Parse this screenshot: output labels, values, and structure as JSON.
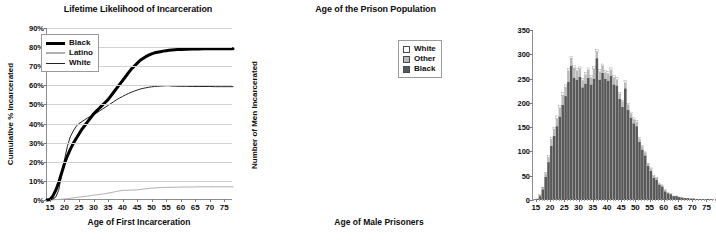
{
  "figure": {
    "background": "#ffffff"
  },
  "charts": [
    {
      "id": "lifetime-likelihood",
      "title": "Lifetime Likelihood of Incarceration",
      "xlabel": "Age of First Incarceration",
      "ylabel": "Cumulative % Incarcerated",
      "legend_position": "top-left",
      "legend": [
        {
          "label": "Black",
          "color": "#000000",
          "style": "thick-line"
        },
        {
          "label": "Latino",
          "color": "#b0b0b0",
          "style": "line"
        },
        {
          "label": "White",
          "color": "#222222",
          "style": "thin-line"
        }
      ],
      "yticks": [
        "0%",
        "10%",
        "20%",
        "30%",
        "40%",
        "50%",
        "60%",
        "70%",
        "80%",
        "90%"
      ],
      "xticks": [
        "15",
        "20",
        "25",
        "30",
        "35",
        "40",
        "45",
        "50",
        "55",
        "60",
        "65",
        "70",
        "75"
      ]
    },
    {
      "id": "age-of-prison-population",
      "title": "Age of the Prison Population",
      "xlabel": "Age of Male Prisoners",
      "ylabel": "Number of Men Incarcerated",
      "legend_position": "top-right",
      "legend": [
        {
          "label": "White",
          "color": "#ffffff",
          "style": "box"
        },
        {
          "label": "Other",
          "color": "#b9b9b9",
          "style": "box"
        },
        {
          "label": "Black",
          "color": "#595959",
          "style": "box"
        }
      ],
      "yticks": [
        "0",
        "50",
        "100",
        "150",
        "200",
        "250",
        "300",
        "350"
      ],
      "xticks": [
        "15",
        "20",
        "25",
        "30",
        "35",
        "40",
        "45",
        "50",
        "55",
        "60",
        "65",
        "70",
        "75"
      ]
    }
  ],
  "chart_data": [
    {
      "type": "line",
      "id": "lifetime-likelihood",
      "title": "Lifetime Likelihood of Incarceration",
      "xlabel": "Age of First Incarceration",
      "ylabel": "Cumulative % Incarcerated",
      "xlim": [
        14,
        78
      ],
      "ylim": [
        0,
        90
      ],
      "grid": true,
      "legend": "top-left inside",
      "x": [
        14,
        15,
        16,
        17,
        18,
        19,
        20,
        21,
        22,
        23,
        24,
        25,
        26,
        27,
        28,
        29,
        30,
        31,
        32,
        33,
        34,
        35,
        36,
        37,
        38,
        39,
        40,
        41,
        42,
        43,
        44,
        45,
        46,
        47,
        48,
        49,
        50,
        51,
        52,
        53,
        54,
        55,
        56,
        57,
        58,
        59,
        60,
        62,
        64,
        66,
        68,
        70,
        72,
        74,
        76,
        78
      ],
      "series": [
        {
          "name": "Black",
          "color": "#000000",
          "values": [
            0,
            0.3,
            2,
            5,
            9,
            14,
            19,
            23,
            26.5,
            29.5,
            32,
            34.5,
            37,
            39,
            41,
            43,
            45,
            46.5,
            48,
            49.5,
            51,
            52.5,
            54.5,
            56.5,
            58.5,
            60.5,
            62.5,
            64.5,
            66.5,
            68.5,
            70,
            71.5,
            73,
            74,
            75,
            75.8,
            76.5,
            77,
            77.3,
            77.6,
            77.9,
            78.1,
            78.3,
            78.5,
            78.6,
            78.7,
            78.8,
            78.9,
            79,
            79,
            79.1,
            79.1,
            79.2,
            79.2,
            79.2,
            79.2
          ]
        },
        {
          "name": "White",
          "color": "#222222",
          "values": [
            0,
            0.2,
            0.5,
            1.5,
            5,
            13,
            21,
            28,
            33,
            36,
            38.5,
            40,
            41,
            42,
            43,
            43.8,
            44.6,
            45.5,
            46.5,
            47.5,
            48.5,
            49.5,
            50.5,
            51.5,
            52.5,
            53.4,
            54.2,
            55,
            55.7,
            56.4,
            57,
            57.5,
            58,
            58.4,
            58.7,
            59,
            59.2,
            59.4,
            59.5,
            59.6,
            59.7,
            59.8,
            59.8,
            59.6,
            59.6,
            59.5,
            59.5,
            59.5,
            59.4,
            59.4,
            59.4,
            59.4,
            59.3,
            59.3,
            59.3,
            59.3
          ]
        },
        {
          "name": "Latino",
          "color": "#b0b0b0",
          "values": [
            0,
            0,
            0.1,
            0.2,
            0.3,
            0.4,
            0.5,
            0.7,
            0.9,
            1.1,
            1.3,
            1.5,
            1.7,
            1.9,
            2.1,
            2.3,
            2.5,
            2.7,
            2.9,
            3.1,
            3.3,
            3.6,
            3.9,
            4.2,
            4.5,
            4.8,
            5,
            5.1,
            5.1,
            5.2,
            5.2,
            5.3,
            5.5,
            5.7,
            5.9,
            6,
            6.2,
            6.3,
            6.4,
            6.5,
            6.5,
            6.6,
            6.6,
            6.7,
            6.7,
            6.7,
            6.8,
            6.8,
            6.8,
            6.9,
            6.9,
            6.9,
            6.9,
            6.9,
            6.9,
            6.9
          ]
        }
      ]
    },
    {
      "type": "bar",
      "id": "age-of-prison-population",
      "subtype": "stacked-histogram",
      "title": "Age of the Prison Population",
      "xlabel": "Age of Male Prisoners",
      "ylabel": "Number of Men Incarcerated",
      "xlim": [
        14,
        78
      ],
      "ylim": [
        0,
        350
      ],
      "grid": false,
      "legend": "top-right inside",
      "bin_width": 1,
      "categories": [
        14,
        15,
        16,
        17,
        18,
        19,
        20,
        21,
        22,
        23,
        24,
        25,
        26,
        27,
        28,
        29,
        30,
        31,
        32,
        33,
        34,
        35,
        36,
        37,
        38,
        39,
        40,
        41,
        42,
        43,
        44,
        45,
        46,
        47,
        48,
        49,
        50,
        51,
        52,
        53,
        54,
        55,
        56,
        57,
        58,
        59,
        60,
        61,
        62,
        63,
        64,
        65,
        66,
        67,
        68,
        69,
        70,
        71,
        72,
        73,
        74,
        75,
        76,
        77,
        78
      ],
      "series": [
        {
          "name": "Black",
          "color": "#595959",
          "values": [
            0,
            2,
            8,
            22,
            48,
            78,
            112,
            132,
            152,
            172,
            196,
            214,
            244,
            276,
            252,
            248,
            254,
            232,
            240,
            252,
            238,
            250,
            292,
            248,
            262,
            250,
            246,
            256,
            238,
            236,
            208,
            192,
            230,
            186,
            170,
            158,
            152,
            120,
            104,
            92,
            70,
            60,
            46,
            42,
            32,
            28,
            18,
            14,
            12,
            8,
            8,
            6,
            5,
            4,
            4,
            3,
            3,
            2,
            2,
            2,
            1,
            2,
            1,
            0,
            0
          ]
        },
        {
          "name": "Other",
          "color": "#b9b9b9",
          "values": [
            0,
            1,
            2,
            3,
            6,
            10,
            13,
            14,
            16,
            18,
            20,
            18,
            22,
            16,
            20,
            18,
            16,
            14,
            18,
            16,
            14,
            20,
            14,
            16,
            14,
            12,
            14,
            12,
            14,
            12,
            10,
            10,
            12,
            10,
            8,
            8,
            8,
            6,
            6,
            5,
            4,
            4,
            3,
            3,
            2,
            2,
            2,
            1,
            1,
            1,
            1,
            1,
            1,
            0,
            0,
            0,
            0,
            0,
            0,
            0,
            0,
            0,
            0,
            0,
            0
          ]
        },
        {
          "name": "White",
          "color": "#ffffff",
          "values": [
            0,
            0,
            1,
            1,
            2,
            3,
            4,
            4,
            5,
            5,
            5,
            5,
            5,
            4,
            5,
            4,
            4,
            4,
            4,
            4,
            4,
            5,
            4,
            4,
            4,
            4,
            4,
            4,
            4,
            4,
            3,
            3,
            4,
            3,
            3,
            3,
            3,
            2,
            2,
            2,
            2,
            2,
            1,
            1,
            1,
            1,
            1,
            1,
            1,
            0,
            0,
            0,
            0,
            0,
            0,
            0,
            0,
            0,
            0,
            0,
            0,
            0,
            0,
            0,
            0
          ]
        }
      ]
    }
  ]
}
